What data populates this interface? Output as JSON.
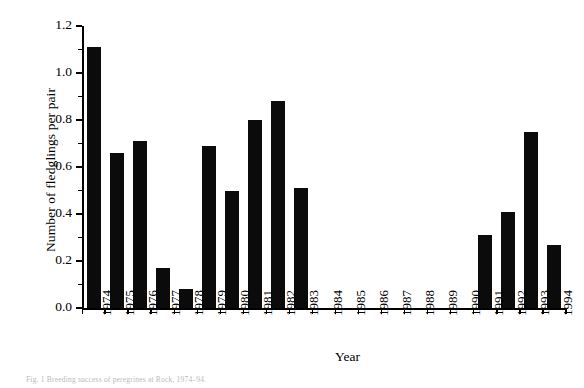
{
  "chart_data": {
    "type": "bar",
    "title": "",
    "xlabel": "Year",
    "ylabel": "Number of fledglings per pair",
    "categories": [
      "1974",
      "1975",
      "1976",
      "1977",
      "1978",
      "1979",
      "1980",
      "1981",
      "1982",
      "1983",
      "1984",
      "1985",
      "1986",
      "1987",
      "1988",
      "1989",
      "1990",
      "1991",
      "1992",
      "1993",
      "1994"
    ],
    "values": [
      1.11,
      0.66,
      0.71,
      0.17,
      0.08,
      0.69,
      0.5,
      0.8,
      0.88,
      0.51,
      null,
      null,
      null,
      null,
      null,
      null,
      null,
      0.31,
      0.41,
      0.75,
      0.27
    ],
    "ylim": [
      0.0,
      1.2
    ],
    "ytick_labels": [
      "0.0",
      "0.2",
      "0.4",
      "0.6",
      "0.8",
      "1.0",
      "1.2"
    ],
    "ytick_values": [
      0.0,
      0.2,
      0.4,
      0.6,
      0.8,
      1.0,
      1.2
    ],
    "yminor_values": [
      0.1,
      0.3,
      0.5,
      0.7,
      0.9,
      1.1
    ],
    "grid": false,
    "legend": null,
    "bar_color": "#0b0b0b",
    "background_color": "#ffffff",
    "axis_color": "#000000",
    "missing_years": [
      "1984",
      "1985",
      "1986",
      "1987",
      "1988",
      "1989",
      "1990"
    ]
  },
  "caption": {
    "text": "Fig. 1  Breeding success of peregrines at Rock, 1974–94."
  }
}
